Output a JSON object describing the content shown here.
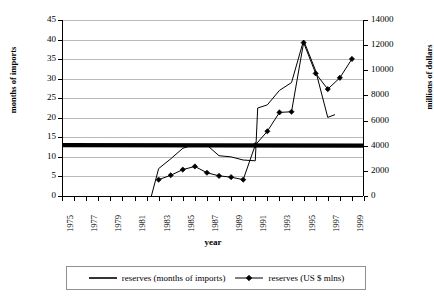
{
  "chart_data": {
    "type": "line",
    "title": "",
    "xlabel": "year",
    "ylabel": "months of imports",
    "y2label": "millions of dollars",
    "grid": true,
    "legend_position": "bottom",
    "xlim": [
      1975,
      2000
    ],
    "ylim": [
      0,
      45
    ],
    "y2lim": [
      0,
      14000
    ],
    "ytick_step": 5,
    "y2tick_step": 2000,
    "x_ticks": [
      1975,
      1976,
      1977,
      1978,
      1979,
      1980,
      1981,
      1982,
      1983,
      1984,
      1985,
      1986,
      1987,
      1988,
      1989,
      1990,
      1991,
      1992,
      1993,
      1994,
      1995,
      1996,
      1997,
      1998,
      1999,
      2000
    ],
    "x_tick_labels": [
      "1975",
      "1977",
      "1979",
      "1981",
      "1983",
      "1985",
      "1987",
      "1989",
      "1991",
      "1993",
      "1995",
      "1997",
      "1999"
    ],
    "x_tick_label_years": [
      1975,
      1977,
      1979,
      1981,
      1983,
      1985,
      1987,
      1989,
      1991,
      1993,
      1995,
      1997,
      1999
    ],
    "y_tick_labels": [
      "0",
      "5",
      "10",
      "15",
      "20",
      "25",
      "30",
      "35",
      "40",
      "45"
    ],
    "y2_tick_labels": [
      "0",
      "2000",
      "4000",
      "6000",
      "8000",
      "10000",
      "12000",
      "14000"
    ],
    "series": [
      {
        "name": "reserves (months of imports)",
        "axis": "left",
        "style": "thin-line-no-marker",
        "color": "#000000",
        "x": [
          1982.4,
          1983,
          1984,
          1985,
          1986,
          1987,
          1988,
          1989,
          1990,
          1991,
          1991.2,
          1992,
          1993,
          1994,
          1995,
          1996,
          1997,
          1997.6
        ],
        "values": [
          0.0,
          7.0,
          9.5,
          12.2,
          13.2,
          13.0,
          10.3,
          10.0,
          9.2,
          9.0,
          22.5,
          23.3,
          27.0,
          29.0,
          39.8,
          32.0,
          20.1,
          20.8
        ]
      },
      {
        "name": "reserves (US $ mlns)",
        "axis": "right",
        "style": "line-with-diamond-markers",
        "color": "#000000",
        "x": [
          1983,
          1984,
          1985,
          1986,
          1987,
          1988,
          1989,
          1990,
          1991,
          1992,
          1993,
          1994,
          1995,
          1996,
          1997,
          1998,
          1999
        ],
        "values": [
          1300,
          1650,
          2100,
          2350,
          1850,
          1600,
          1500,
          1300,
          4050,
          5150,
          6650,
          6700,
          12200,
          9750,
          8500,
          9400,
          10900
        ]
      },
      {
        "name": "reserves (months of imports) benchmark",
        "axis": "left",
        "style": "thick-flat-line",
        "color": "#000000",
        "x": [
          1975,
          2000
        ],
        "values": [
          13.0,
          12.9
        ]
      }
    ]
  },
  "legend": {
    "items": [
      {
        "label": "reserves (months of imports)",
        "marker": "none",
        "icon": "line-swatch-icon"
      },
      {
        "label": "reserves (US $ mlns)",
        "marker": "diamond",
        "icon": "line-diamond-swatch-icon"
      }
    ]
  },
  "colors": {
    "gridline": "#b9b9b9",
    "axis": "#000000",
    "series": "#000000",
    "legend_border": "#909090",
    "background": "#ffffff"
  }
}
